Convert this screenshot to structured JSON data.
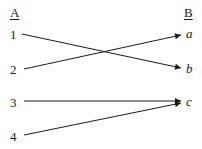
{
  "headers": {
    "left": "A",
    "right": "B"
  },
  "left_items": [
    "1",
    "2",
    "3",
    "4"
  ],
  "right_items": [
    "a",
    "b",
    "c"
  ],
  "mappings": [
    {
      "from": "1",
      "to": "b"
    },
    {
      "from": "2",
      "to": "a"
    },
    {
      "from": "3",
      "to": "c"
    },
    {
      "from": "4",
      "to": "c"
    }
  ],
  "colors": {
    "ink": "#1a1a1a",
    "background": "#ffffff"
  }
}
